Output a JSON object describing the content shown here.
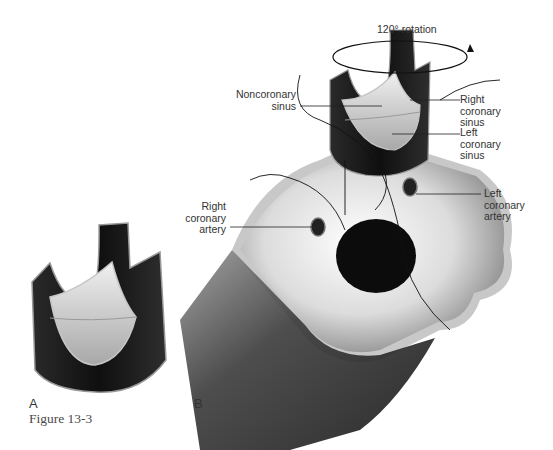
{
  "figure": {
    "caption": "Figure 13-3",
    "panels": [
      {
        "id": "A",
        "label": "A"
      },
      {
        "id": "B",
        "label": "B"
      }
    ]
  },
  "labels": {
    "rotation": "120° rotation",
    "noncoronary_sinus": "Noncoronary\nsinus",
    "right_coronary_sinus": "Right\ncoronary\nsinus",
    "left_coronary_sinus": "Left\ncoronary\nsinus",
    "right_coronary_artery": "Right\ncoronary\nartery",
    "left_coronary_artery": "Left\ncoronary\nartery"
  },
  "colors": {
    "dark_wall": "#1c1c1c",
    "cusp_light": "#d8d8d8",
    "annulus_light": "#e6e6e6",
    "rim": "#b8b8b8",
    "text": "#333333"
  }
}
